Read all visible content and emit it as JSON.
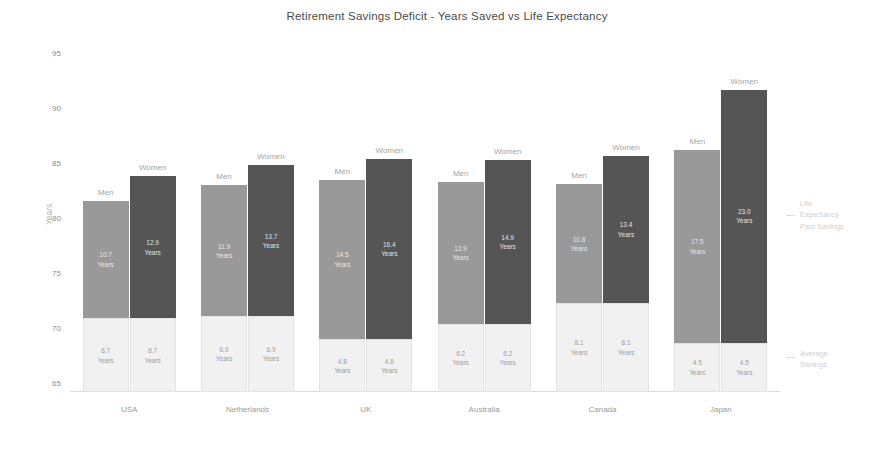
{
  "chart_data": {
    "type": "bar",
    "subtype": "grouped-stacked",
    "title": "Retirement Savings Deficit - Years Saved vs Life Expectancy",
    "xlabel": "",
    "ylabel": "Years",
    "ylim": [
      65,
      95
    ],
    "yticks": [
      65,
      70,
      75,
      80,
      85,
      90,
      95
    ],
    "ytick_labels": [
      "65",
      "70",
      "75",
      "80",
      "85",
      "90",
      "95"
    ],
    "grid": false,
    "legend_position": "right-annotations",
    "baseline": 65,
    "categories": [
      "USA",
      "Netherlands",
      "UK",
      "Australia",
      "Canada",
      "Japan"
    ],
    "group_labels": [
      "Men",
      "Women"
    ],
    "series": [
      {
        "name": "Average Savings",
        "color": "#f1f1f1",
        "men_values": [
          6.7,
          6.9,
          4.8,
          6.2,
          8.1,
          4.5
        ],
        "women_values": [
          6.7,
          6.9,
          4.8,
          6.2,
          8.1,
          4.5
        ]
      },
      {
        "name": "Life Expectancy Past Savings",
        "men_color": "#999999",
        "women_color": "#555555",
        "men_values": [
          10.7,
          11.9,
          14.5,
          12.9,
          10.8,
          17.5
        ],
        "women_values": [
          12.9,
          13.7,
          16.4,
          14.9,
          13.4,
          23.0
        ]
      }
    ],
    "life_expectancy": {
      "men": [
        82.4,
        83.8,
        84.3,
        84.1,
        83.9,
        87.0
      ],
      "women": [
        84.6,
        85.6,
        86.2,
        86.1,
        86.5,
        92.5
      ]
    },
    "annotations": [
      {
        "id": "deficit",
        "text": "Life\nExpectancy\nPast Savings"
      },
      {
        "id": "savings",
        "text": "Average\nSavings"
      }
    ],
    "bars": [
      {
        "category": "USA",
        "men": {
          "top_label": "Men",
          "savings": "6.7\nYears",
          "savings_value": 6.7,
          "deficit": "10.7\nYears",
          "deficit_value": 10.7,
          "total": 82.4
        },
        "women": {
          "top_label": "Women",
          "savings": "6.7\nYears",
          "savings_value": 6.7,
          "deficit": "12.9\nYears",
          "deficit_value": 12.9,
          "total": 84.6
        }
      },
      {
        "category": "Netherlands",
        "men": {
          "top_label": "Men",
          "savings": "6.9\nYears",
          "savings_value": 6.9,
          "deficit": "11.9\nYears",
          "deficit_value": 11.9,
          "total": 83.8
        },
        "women": {
          "top_label": "Women",
          "savings": "6.9\nYears",
          "savings_value": 6.9,
          "deficit": "13.7\nYears",
          "deficit_value": 13.7,
          "total": 85.6
        }
      },
      {
        "category": "UK",
        "men": {
          "top_label": "Men",
          "savings": "4.8\nYears",
          "savings_value": 4.8,
          "deficit": "14.5\nYears",
          "deficit_value": 14.5,
          "total": 84.3
        },
        "women": {
          "top_label": "Women",
          "savings": "4.8\nYears",
          "savings_value": 4.8,
          "deficit": "16.4\nYears",
          "deficit_value": 16.4,
          "total": 86.2
        }
      },
      {
        "category": "Australia",
        "men": {
          "top_label": "Men",
          "savings": "6.2\nYears",
          "savings_value": 6.2,
          "deficit": "12.9\nYears",
          "deficit_value": 12.9,
          "total": 84.1
        },
        "women": {
          "top_label": "Women",
          "savings": "6.2\nYears",
          "savings_value": 6.2,
          "deficit": "14.9\nYears",
          "deficit_value": 14.9,
          "total": 86.1
        }
      },
      {
        "category": "Canada",
        "men": {
          "top_label": "Men",
          "savings": "8.1\nYears",
          "savings_value": 8.1,
          "deficit": "10.8\nYears",
          "deficit_value": 10.8,
          "total": 83.9
        },
        "women": {
          "top_label": "Women",
          "savings": "8.1\nYears",
          "savings_value": 8.1,
          "deficit": "13.4\nYears",
          "deficit_value": 13.4,
          "total": 86.5
        }
      },
      {
        "category": "Japan",
        "men": {
          "top_label": "Men",
          "savings": "4.5\nYears",
          "savings_value": 4.5,
          "deficit": "17.5\nYears",
          "deficit_value": 17.5,
          "total": 87.0
        },
        "women": {
          "top_label": "Women",
          "savings": "4.5\nYears",
          "savings_value": 4.5,
          "deficit": "23.0\nYears",
          "deficit_value": 23.0,
          "total": 92.5
        }
      }
    ]
  }
}
